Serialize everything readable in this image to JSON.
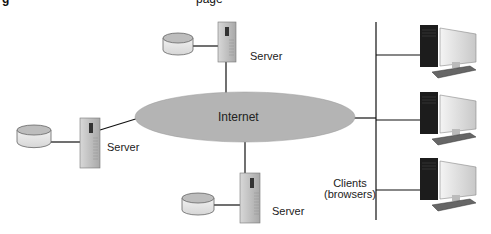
{
  "title_fragment": {
    "left": "g",
    "right": "page"
  },
  "network": {
    "label": "Internet",
    "fill": "#b4b4b4"
  },
  "servers": [
    {
      "label": "Server",
      "position": "top"
    },
    {
      "label": "Server",
      "position": "left"
    },
    {
      "label": "Server",
      "position": "bottom"
    }
  ],
  "clients": {
    "label_line1": "Clients",
    "label_line2": "(browsers)",
    "count": 3
  }
}
